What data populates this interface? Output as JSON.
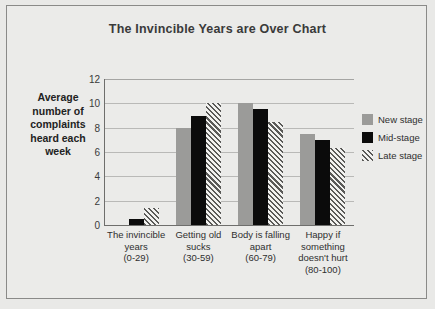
{
  "chart_data": {
    "type": "bar",
    "title": "The Invincible Years are Over Chart",
    "xlabel": "",
    "ylabel": "Average number of complaints heard each week",
    "ylabel_lines": [
      "Average",
      "number of",
      "complaints",
      "heard each",
      "week"
    ],
    "ylim": [
      0,
      12
    ],
    "ytick_step": 2,
    "yticks": [
      0,
      2,
      4,
      6,
      8,
      10,
      12
    ],
    "ytick_labels": [
      "0",
      "2",
      "4",
      "6",
      "8",
      "10",
      "12"
    ],
    "grid": true,
    "grid_axis": "y",
    "legend_position": "right",
    "categories": [
      "The invincible years (0-29)",
      "Getting old sucks (30-59)",
      "Body is falling apart (60-79)",
      "Happy if something doesn't hurt (80-100)"
    ],
    "category_label_lines": [
      [
        "The invincible",
        "years",
        "(0-29)"
      ],
      [
        "Getting old",
        "sucks",
        "(30-59)"
      ],
      [
        "Body is falling",
        "apart",
        "(60-79)"
      ],
      [
        "Happy if",
        "something",
        "doesn't hurt",
        "(80-100)"
      ]
    ],
    "series": [
      {
        "name": "New stage",
        "color": "#9b9b99",
        "pattern": "solid",
        "values": [
          0,
          8,
          10,
          7.5
        ]
      },
      {
        "name": "Mid-stage",
        "color": "#0b0b0b",
        "pattern": "solid",
        "values": [
          0.5,
          9,
          9.5,
          7
        ]
      },
      {
        "name": "Late stage",
        "color": "#5a5a58",
        "pattern": "hatch",
        "values": [
          1.4,
          10,
          8.5,
          6.3
        ]
      }
    ]
  },
  "colors": {
    "page_background": "#e9e9e7",
    "frame_border": "#8a8a88",
    "plot_background": "#ebebe9",
    "gridline": "#b9b9b7",
    "axis_line": "#6e6e6c",
    "title_text": "#3a3a3a",
    "label_text": "#2f2f2f"
  }
}
